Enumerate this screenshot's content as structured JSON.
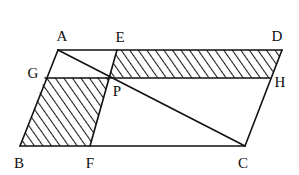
{
  "figure": {
    "name": "parallelogram-with-transversals",
    "canvas": {
      "width": 299,
      "height": 175
    },
    "colors": {
      "background": "#ffffff",
      "stroke": "#111111",
      "hatch": "#1a1a1a",
      "label": "#0d0d0d"
    },
    "stroke_width": 1.6,
    "hatch_spacing": 7,
    "hatch_angle_deg": -35
  },
  "points": {
    "A": {
      "label": "A",
      "x": 58,
      "y": 50,
      "label_x": 62,
      "label_y": 36
    },
    "B": {
      "label": "B",
      "x": 20,
      "y": 146,
      "label_x": 19,
      "label_y": 163
    },
    "C": {
      "label": "C",
      "x": 245,
      "y": 146,
      "label_x": 243,
      "label_y": 163
    },
    "D": {
      "label": "D",
      "x": 282,
      "y": 50,
      "label_x": 277,
      "label_y": 36
    },
    "E": {
      "label": "E",
      "x": 117,
      "y": 50,
      "label_x": 120,
      "label_y": 37
    },
    "F": {
      "label": "F",
      "x": 90,
      "y": 146,
      "label_x": 90,
      "label_y": 163
    },
    "G": {
      "label": "G",
      "x": 45,
      "y": 78,
      "label_x": 33,
      "label_y": 73
    },
    "H": {
      "label": "H",
      "x": 270,
      "y": 78,
      "label_x": 280,
      "label_y": 82
    },
    "P": {
      "label": "P",
      "x": 110,
      "y": 77,
      "label_x": 117,
      "label_y": 91
    }
  },
  "segments": [
    {
      "name": "side-AB",
      "from": "A",
      "to": "B"
    },
    {
      "name": "side-BC",
      "from": "B",
      "to": "C"
    },
    {
      "name": "side-CD",
      "from": "C",
      "to": "D"
    },
    {
      "name": "side-DA",
      "from": "D",
      "to": "A"
    },
    {
      "name": "line-GH",
      "from": "G",
      "to": "H"
    },
    {
      "name": "line-EF",
      "from": "E",
      "to": "F"
    },
    {
      "name": "diagonal-AC",
      "from": "A",
      "to": "C"
    }
  ],
  "hatched_regions": [
    {
      "name": "region-EDHP",
      "vertices": [
        "E",
        "D",
        "H",
        "P"
      ]
    },
    {
      "name": "region-GPFB",
      "vertices": [
        "G",
        "P",
        "F",
        "B"
      ]
    }
  ]
}
